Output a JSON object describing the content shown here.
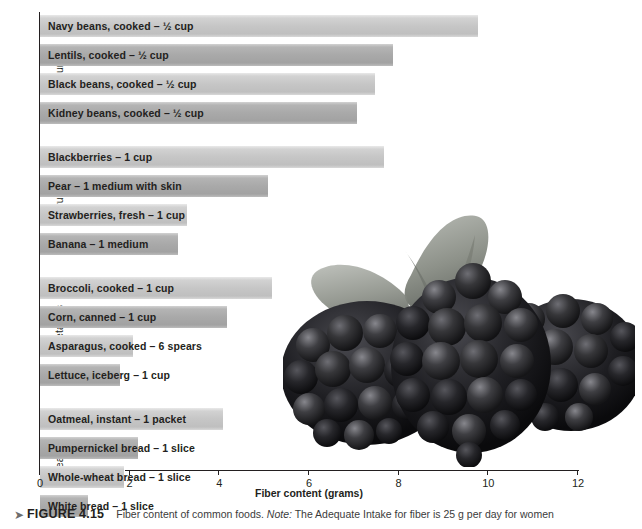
{
  "figure": {
    "number_label": "FIGURE 4.15",
    "caption_text": "Fiber content of common foods.",
    "note_word": "Note:",
    "note_text": "The Adequate Intake for fiber is 25 g per day for women",
    "bullet_icon": "bullet-marker-icon"
  },
  "photo": {
    "name": "blackberries-photo",
    "alt": "Three ripe blackberries with a leaf"
  },
  "chart_data": {
    "type": "bar",
    "orientation": "horizontal",
    "title": "Fiber content of common foods",
    "xlabel": "Fiber content (grams)",
    "ylabel": "",
    "xlim": [
      0,
      12
    ],
    "xticks": [
      0,
      2,
      4,
      6,
      8,
      10,
      12
    ],
    "xtick_labels": [
      "0",
      "2",
      "4",
      "6",
      "8",
      "10",
      "12"
    ],
    "grid": false,
    "legend": "none",
    "value_unit": "grams",
    "groups": [
      {
        "name": "Legumes",
        "items": [
          {
            "label": "Navy beans, cooked – ½ cup",
            "value": 9.8,
            "shade": "light"
          },
          {
            "label": "Lentils, cooked – ½ cup",
            "value": 7.9,
            "shade": "dark"
          },
          {
            "label": "Black beans, cooked – ½ cup",
            "value": 7.5,
            "shade": "light"
          },
          {
            "label": "Kidney beans, cooked – ½ cup",
            "value": 7.1,
            "shade": "dark"
          }
        ]
      },
      {
        "name": "Fruits",
        "items": [
          {
            "label": "Blackberries – 1 cup",
            "value": 7.7,
            "shade": "light"
          },
          {
            "label": "Pear – 1 medium with skin",
            "value": 5.1,
            "shade": "dark"
          },
          {
            "label": "Strawberries, fresh – 1 cup",
            "value": 3.3,
            "shade": "light"
          },
          {
            "label": "Banana – 1 medium",
            "value": 3.1,
            "shade": "dark"
          }
        ]
      },
      {
        "name": "Vegetables",
        "items": [
          {
            "label": "Broccoli, cooked – 1 cup",
            "value": 5.2,
            "shade": "light"
          },
          {
            "label": "Corn, canned – 1 cup",
            "value": 4.2,
            "shade": "dark"
          },
          {
            "label": "Asparagus, cooked – 6 spears",
            "value": 2.1,
            "shade": "light"
          },
          {
            "label": "Lettuce, iceberg – 1 cup",
            "value": 1.8,
            "shade": "dark"
          }
        ]
      },
      {
        "name": "Breads",
        "items": [
          {
            "label": "Oatmeal, instant – 1 packet",
            "value": 4.1,
            "shade": "light"
          },
          {
            "label": "Pumpernickel bread – 1 slice",
            "value": 2.2,
            "shade": "dark"
          },
          {
            "label": "Whole-wheat bread – 1 slice",
            "value": 1.9,
            "shade": "light"
          },
          {
            "label": "White bread – 1 slice",
            "value": 1.1,
            "shade": "dark"
          }
        ]
      }
    ]
  },
  "colors": {
    "bar_light": "#c6c6c6",
    "bar_dark": "#a9a9a9",
    "axis": "#231f20",
    "text": "#231f20",
    "caption_text": "#3b3b3b"
  }
}
